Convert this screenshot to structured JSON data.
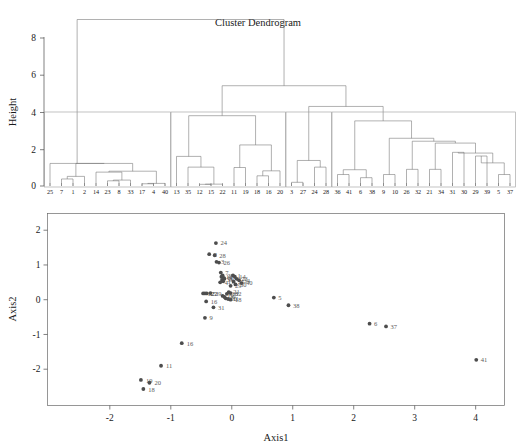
{
  "figure": {
    "title": "Cluster Dendrogram",
    "background_color": "#ffffff",
    "ink_color": "#1a1a1a"
  },
  "chart_data": [
    {
      "type": "dendrogram",
      "title": "Cluster Dendrogram",
      "xlabel": "",
      "ylabel": "Height",
      "ylim": [
        0,
        9.4
      ],
      "yticks": [
        0,
        2,
        4,
        6,
        8
      ],
      "ytick_labels": [
        "0",
        "2",
        "4",
        "6",
        "8"
      ],
      "grid": false,
      "cut_rectangles": 4,
      "cut_height": 4.0,
      "leaf_order": [
        "25",
        "7",
        "1",
        "2",
        "14",
        "23",
        "8",
        "33",
        "17",
        "4",
        "40",
        "13",
        "35",
        "12",
        "15",
        "22",
        "11",
        "19",
        "18",
        "16",
        "20",
        "3",
        "27",
        "24",
        "28",
        "36",
        "41",
        "6",
        "38",
        "9",
        "10",
        "26",
        "32",
        "21",
        "34",
        "31",
        "30",
        "29",
        "39",
        "5",
        "37"
      ],
      "clusters": [
        {
          "id": 1,
          "leaves": [
            "25",
            "7",
            "1",
            "2",
            "14",
            "23",
            "8",
            "33",
            "17",
            "4",
            "40"
          ]
        },
        {
          "id": 2,
          "leaves": [
            "13",
            "35",
            "12",
            "15",
            "22",
            "11",
            "19",
            "18",
            "16",
            "20"
          ]
        },
        {
          "id": 3,
          "leaves": [
            "3",
            "27",
            "24",
            "28"
          ]
        },
        {
          "id": 4,
          "leaves": [
            "36",
            "41",
            "6",
            "38",
            "9",
            "10",
            "26",
            "32",
            "21",
            "34",
            "31",
            "30",
            "29",
            "39",
            "5",
            "37"
          ]
        }
      ],
      "merges": [
        {
          "left": "7",
          "right": "1",
          "height": 0.38
        },
        {
          "left": "n7_1",
          "right": "2",
          "height": 0.12
        },
        {
          "left": "23",
          "right": "8",
          "height": 0.28
        },
        {
          "left": "n23_8",
          "right": "33",
          "height": 0.3
        },
        {
          "left": "17",
          "right": "4",
          "height": 0.1
        },
        {
          "left": "n17_4",
          "right": "40",
          "height": 0.08
        },
        {
          "left": "14",
          "right": "n23_8_33",
          "height": 0.75
        },
        {
          "left": "n14c",
          "right": "n17_4_40",
          "height": 0.8
        },
        {
          "left": "n7_1_2",
          "right": "nright",
          "height": 1.22
        },
        {
          "left": "25",
          "right": "nall1",
          "height": 1.22
        },
        {
          "left": "12",
          "right": "15",
          "height": 0.08
        },
        {
          "left": "n12_15",
          "right": "22",
          "height": 0.06
        },
        {
          "left": "35",
          "right": "n12_15_22",
          "height": 1.02
        },
        {
          "left": "13",
          "right": "n35c",
          "height": 1.6
        },
        {
          "left": "11",
          "right": "19",
          "height": 1.0
        },
        {
          "left": "18",
          "right": "16",
          "height": 0.55
        },
        {
          "left": "n18_16",
          "right": "20",
          "height": 0.82
        },
        {
          "left": "n11_19",
          "right": "n18_16_20",
          "height": 2.22
        },
        {
          "left": "n13c",
          "right": "n11c",
          "height": 3.8
        },
        {
          "left": "3",
          "right": "27",
          "height": 0.18
        },
        {
          "left": "24",
          "right": "28",
          "height": 1.02
        },
        {
          "left": "n3_27",
          "right": "n24_28",
          "height": 1.38
        },
        {
          "left": "36",
          "right": "41",
          "height": 0.88
        },
        {
          "left": "6",
          "right": "38",
          "height": 0.45
        },
        {
          "left": "n36_41",
          "right": "n6_38",
          "height": 0.88
        },
        {
          "left": "9",
          "right": "10",
          "height": 0.62
        },
        {
          "left": "26",
          "right": "32",
          "height": 0.9
        },
        {
          "left": "21",
          "right": "34",
          "height": 0.9
        },
        {
          "left": "31",
          "right": "30",
          "height": 1.82
        },
        {
          "left": "29",
          "right": "39",
          "height": 1.62
        },
        {
          "left": "5",
          "right": "37",
          "height": 0.62
        },
        {
          "left": "n29_39",
          "right": "n5_37",
          "height": 1.25
        },
        {
          "left": "n31_30",
          "right": "nlast",
          "height": 1.72
        },
        {
          "left": "n21_34",
          "right": "nchain",
          "height": 2.32
        },
        {
          "left": "n26_32",
          "right": "nchain2",
          "height": 2.42
        },
        {
          "left": "n9_10",
          "right": "nchain3",
          "height": 2.58
        },
        {
          "left": "n36c",
          "right": "nchain4",
          "height": 3.52
        },
        {
          "left": "n3c",
          "right": "n36c2",
          "height": 4.3
        },
        {
          "left": "n13big",
          "right": "n3big",
          "height": 5.42
        },
        {
          "left": "ncluster1",
          "right": "nrest",
          "height": 9.0
        }
      ]
    },
    {
      "type": "scatter",
      "title": "",
      "xlabel": "Axis1",
      "ylabel": "Axis2",
      "xlim": [
        -2.85,
        4.35
      ],
      "ylim": [
        -2.8,
        2.15
      ],
      "xticks": [
        -2,
        -1,
        0,
        1,
        2,
        3,
        4
      ],
      "xtick_labels": [
        "-2",
        "-1",
        "0",
        "1",
        "2",
        "3",
        "4"
      ],
      "yticks": [
        -2,
        -1,
        0,
        1,
        2
      ],
      "ytick_labels": [
        "-2",
        "-1",
        "0",
        "1",
        "2"
      ],
      "grid": false,
      "point_color": "#4d4d4d",
      "label_color": "#5a5a5a",
      "points": [
        {
          "label": "24",
          "x": -0.26,
          "y": 1.63
        },
        {
          "label": "2",
          "x": -0.37,
          "y": 1.31
        },
        {
          "label": "28",
          "x": -0.28,
          "y": 1.28
        },
        {
          "label": "3",
          "x": -0.25,
          "y": 1.09
        },
        {
          "label": "26",
          "x": -0.21,
          "y": 1.07
        },
        {
          "label": "7",
          "x": -0.18,
          "y": 0.78
        },
        {
          "label": "27",
          "x": -0.15,
          "y": 0.7
        },
        {
          "label": "13",
          "x": -0.17,
          "y": 0.66
        },
        {
          "label": "35",
          "x": -0.13,
          "y": 0.63
        },
        {
          "label": "8",
          "x": -0.12,
          "y": 0.6
        },
        {
          "label": "33",
          "x": -0.16,
          "y": 0.57
        },
        {
          "label": "17",
          "x": -0.14,
          "y": 0.53
        },
        {
          "label": "4",
          "x": -0.19,
          "y": 0.5
        },
        {
          "label": "1",
          "x": 0.02,
          "y": 0.7
        },
        {
          "label": "14",
          "x": 0.05,
          "y": 0.66
        },
        {
          "label": "23",
          "x": 0.08,
          "y": 0.6
        },
        {
          "label": "34",
          "x": 0.12,
          "y": 0.56
        },
        {
          "label": "40",
          "x": 0.16,
          "y": 0.48
        },
        {
          "label": "25",
          "x": 0.03,
          "y": 0.52
        },
        {
          "label": "30",
          "x": 0.06,
          "y": 0.44
        },
        {
          "label": "29",
          "x": -0.02,
          "y": 0.4
        },
        {
          "label": "21",
          "x": -0.05,
          "y": 0.22
        },
        {
          "label": "32",
          "x": -0.02,
          "y": 0.19
        },
        {
          "label": "36",
          "x": -0.08,
          "y": 0.17
        },
        {
          "label": "12",
          "x": -0.47,
          "y": 0.18
        },
        {
          "label": "15",
          "x": -0.44,
          "y": 0.18
        },
        {
          "label": "22",
          "x": -0.41,
          "y": 0.18
        },
        {
          "label": "39",
          "x": -0.35,
          "y": 0.19
        },
        {
          "label": "10",
          "x": -0.1,
          "y": 0.04
        },
        {
          "label": "11",
          "x": -0.06,
          "y": 0.02
        },
        {
          "label": "18",
          "x": -0.02,
          "y": 0.0
        },
        {
          "label": "20",
          "x": -0.12,
          "y": 0.08
        },
        {
          "label": "19",
          "x": -0.15,
          "y": 0.11
        },
        {
          "label": "31",
          "x": -0.3,
          "y": -0.22
        },
        {
          "label": "16",
          "x": -0.42,
          "y": -0.05
        },
        {
          "label": "9",
          "x": -0.44,
          "y": -0.52
        },
        {
          "label": "5",
          "x": 0.69,
          "y": 0.06
        },
        {
          "label": "38",
          "x": 0.93,
          "y": -0.16
        },
        {
          "label": "6",
          "x": 2.26,
          "y": -0.69
        },
        {
          "label": "37",
          "x": 2.53,
          "y": -0.77
        },
        {
          "label": "41",
          "x": 4.01,
          "y": -1.73
        }
      ],
      "outlier_labels": [
        {
          "label": "16",
          "x": -0.82,
          "y": -1.25
        },
        {
          "label": "11",
          "x": -1.16,
          "y": -1.9
        },
        {
          "label": "19",
          "x": -1.49,
          "y": -2.31
        },
        {
          "label": "20",
          "x": -1.35,
          "y": -2.39
        },
        {
          "label": "18",
          "x": -1.45,
          "y": -2.57
        }
      ]
    }
  ]
}
